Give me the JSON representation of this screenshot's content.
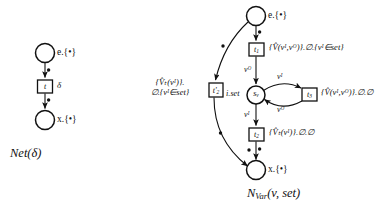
{
  "figure": {
    "background": "#ffffff",
    "ink": "#111111"
  },
  "left_net": {
    "caption": "Net(δ)",
    "places": [
      {
        "id": "e",
        "label": "e.{•}"
      },
      {
        "id": "x",
        "label": "x.{•}"
      }
    ],
    "transitions": [
      {
        "id": "t",
        "box_label": "t",
        "side_label": "δ"
      }
    ],
    "arc_tokens": [
      "•",
      "•"
    ]
  },
  "right_net": {
    "caption_main": "N",
    "caption_sub": "Var",
    "caption_args": "(v, set)",
    "caption_full": "N_Var(v, set)",
    "places": [
      {
        "id": "e",
        "label": "e.{•}"
      },
      {
        "id": "sv",
        "box_label": "s",
        "box_sub": "v",
        "side_label": "i.set"
      },
      {
        "id": "x",
        "label": "x.{•}"
      }
    ],
    "transitions": [
      {
        "id": "t1",
        "box_label": "t",
        "box_sub": "1",
        "annotation": "{V̂(vᴵ,vᴼ)}.∅.{vᴵ∈set}"
      },
      {
        "id": "t2",
        "box_label": "t",
        "box_sub": "2",
        "annotation": "{V̂ₜ(vᴵ)}.∅.∅"
      },
      {
        "id": "t3",
        "box_label": "t",
        "box_sub": "3",
        "annotation": "{V̂(vᴵ,vᴼ)}.∅.∅"
      },
      {
        "id": "t2p",
        "box_label": "t'",
        "box_sub": "2",
        "annotation_line1": "{V̂ₜ(vᴵ)}.",
        "annotation_line2": "∅.{vᴵ∈set}"
      }
    ],
    "arc_labels": [
      {
        "id": "arc-t1-sv",
        "text": "vᴼ"
      },
      {
        "id": "arc-sv-t3",
        "text": "vᴵ"
      },
      {
        "id": "arc-t3-sv",
        "text": "vᴼ"
      },
      {
        "id": "arc-sv-t2",
        "text": "vᴵ"
      }
    ],
    "arc_tokens": [
      "•",
      "•",
      "•",
      "•",
      "•"
    ]
  }
}
